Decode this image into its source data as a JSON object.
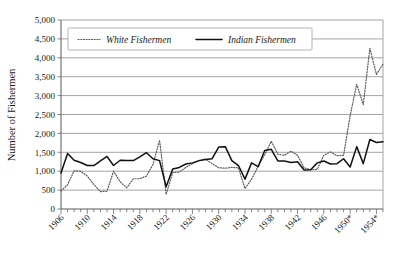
{
  "chart_data": {
    "type": "line",
    "title": "",
    "xlabel": "",
    "ylabel": "Number of Fishermen",
    "ylim": [
      0,
      5000
    ],
    "xlim": [
      1906,
      1955
    ],
    "grid": true,
    "legend_position": "top-left",
    "y_ticks": [
      "0",
      "500",
      "1,000",
      "1,500",
      "2,000",
      "2,500",
      "3,000",
      "3,500",
      "4,000",
      "4,500",
      "5,000"
    ],
    "y_tick_values": [
      0,
      500,
      1000,
      1500,
      2000,
      2500,
      3000,
      3500,
      4000,
      4500,
      5000
    ],
    "x_tick_labels": [
      "1906",
      "1910",
      "1914",
      "1918",
      "1922",
      "1926",
      "1930",
      "1934",
      "1938",
      "1942",
      "1946",
      "1950*",
      "1954*"
    ],
    "x_tick_values": [
      1906,
      1910,
      1914,
      1918,
      1922,
      1926,
      1930,
      1934,
      1938,
      1942,
      1946,
      1950,
      1954
    ],
    "x": [
      1906,
      1907,
      1908,
      1909,
      1910,
      1911,
      1912,
      1913,
      1914,
      1915,
      1916,
      1917,
      1918,
      1919,
      1920,
      1921,
      1922,
      1923,
      1924,
      1925,
      1926,
      1927,
      1928,
      1929,
      1930,
      1931,
      1932,
      1933,
      1934,
      1935,
      1936,
      1937,
      1938,
      1939,
      1940,
      1941,
      1942,
      1943,
      1944,
      1945,
      1946,
      1947,
      1948,
      1949,
      1950,
      1951,
      1952,
      1953,
      1954,
      1955
    ],
    "series": [
      {
        "name": "White Fishermen",
        "style": "dotted",
        "color": "#5b5b5b",
        "values": [
          480,
          640,
          1010,
          1000,
          870,
          650,
          460,
          470,
          1000,
          720,
          560,
          800,
          800,
          870,
          1180,
          1820,
          390,
          960,
          980,
          1100,
          1200,
          1280,
          1320,
          1200,
          1090,
          1080,
          1100,
          1090,
          540,
          790,
          1130,
          1440,
          1790,
          1450,
          1420,
          1530,
          1420,
          1090,
          1040,
          1050,
          1420,
          1510,
          1410,
          1420,
          2470,
          3300,
          2760,
          4250,
          3560,
          3830
        ]
      },
      {
        "name": "Indian Fishermen",
        "style": "solid",
        "color": "#111111",
        "values": [
          950,
          1470,
          1290,
          1230,
          1150,
          1150,
          1270,
          1390,
          1150,
          1290,
          1280,
          1280,
          1380,
          1490,
          1330,
          1280,
          590,
          1060,
          1100,
          1190,
          1220,
          1280,
          1310,
          1330,
          1640,
          1650,
          1280,
          1150,
          790,
          1220,
          1120,
          1550,
          1580,
          1270,
          1270,
          1230,
          1250,
          1030,
          1040,
          1220,
          1270,
          1190,
          1200,
          1330,
          1110,
          1650,
          1200,
          1840,
          1760,
          1780
        ]
      }
    ]
  },
  "legend": {
    "entries": [
      {
        "label": "White Fishermen",
        "marker": "dotted-line-swatch"
      },
      {
        "label": "Indian Fishermen",
        "marker": "solid-line-swatch"
      }
    ]
  }
}
